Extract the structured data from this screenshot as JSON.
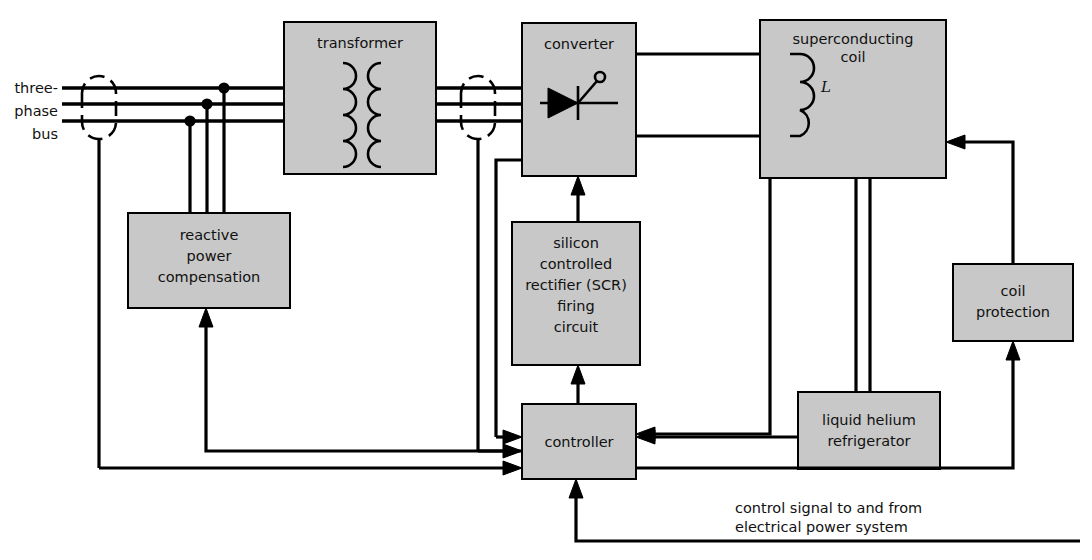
{
  "diagram": {
    "fill_color": "#c8c8c8",
    "line_color": "#000000",
    "background": "#ffffff"
  },
  "labels": {
    "bus_line1": "three-",
    "bus_line2": "phase",
    "bus_line3": "bus",
    "transformer": "transformer",
    "converter": "converter",
    "coil_line1": "superconducting",
    "coil_line2": "coil",
    "inductor_symbol": "L",
    "reactive_line1": "reactive",
    "reactive_line2": "power",
    "reactive_line3": "compensation",
    "scr_line1": "silicon",
    "scr_line2": "controlled",
    "scr_line3": "rectifier (SCR)",
    "scr_line4": "firing",
    "scr_line5": "circuit",
    "controller": "controller",
    "refrigerator_line1": "liquid helium",
    "refrigerator_line2": "refrigerator",
    "coil_protection_line1": "coil",
    "coil_protection_line2": "protection",
    "control_signal_line1": "control signal to and from",
    "control_signal_line2": "electrical power system"
  },
  "blocks": [
    {
      "name": "transformer",
      "x": 284,
      "y": 22,
      "w": 152,
      "h": 152
    },
    {
      "name": "converter",
      "x": 522,
      "y": 23,
      "w": 114,
      "h": 153
    },
    {
      "name": "superconducting-coil",
      "x": 760,
      "y": 20,
      "w": 186,
      "h": 158
    },
    {
      "name": "reactive-power-compensation",
      "x": 128,
      "y": 213,
      "w": 162,
      "h": 95
    },
    {
      "name": "scr-firing-circuit",
      "x": 512,
      "y": 222,
      "w": 128,
      "h": 143
    },
    {
      "name": "controller",
      "x": 522,
      "y": 404,
      "w": 114,
      "h": 75
    },
    {
      "name": "liquid-helium-refrigerator",
      "x": 798,
      "y": 392,
      "w": 142,
      "h": 77
    },
    {
      "name": "coil-protection",
      "x": 953,
      "y": 264,
      "w": 120,
      "h": 77
    }
  ]
}
